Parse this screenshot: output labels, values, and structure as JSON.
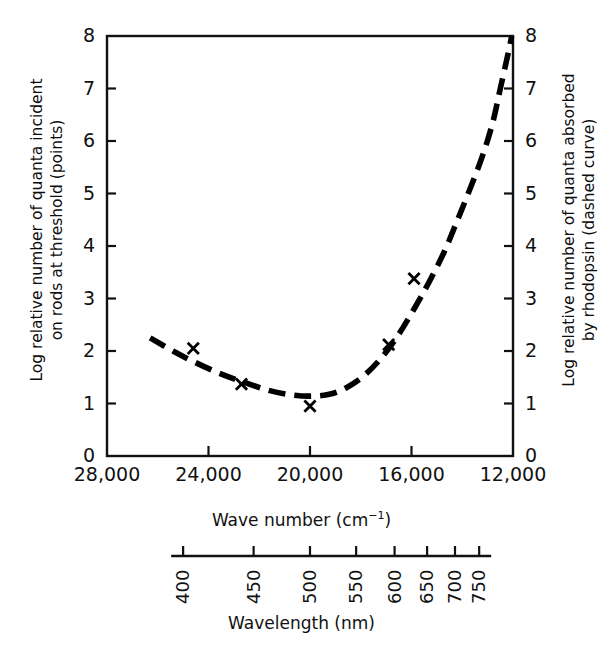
{
  "chart_data": {
    "type": "scatter",
    "title": "",
    "xlabel": "Wave number (cm⁻¹)",
    "ylabel": "Log relative number of quanta incident on rods at threshold (points)",
    "y2label": "Log relative number of quanta absorbed by rhodopsin (dashed curve)",
    "secondary_xlabel": "Wavelength (nm)",
    "xlim": [
      28000,
      12000
    ],
    "ylim": [
      0,
      8
    ],
    "y2lim": [
      0,
      8
    ],
    "x_inverted": true,
    "grid": false,
    "legend": "none",
    "xticks": [
      28000,
      24000,
      20000,
      16000,
      12000
    ],
    "xticklabels": [
      "28,000",
      "24,000",
      "20,000",
      "16,000",
      "12,000"
    ],
    "yticks": [
      0,
      1,
      2,
      3,
      4,
      5,
      6,
      7,
      8
    ],
    "yticklabels": [
      "0",
      "1",
      "2",
      "3",
      "4",
      "5",
      "6",
      "7",
      "8"
    ],
    "y2ticks": [
      0,
      1,
      2,
      3,
      4,
      5,
      6,
      7,
      8
    ],
    "y2ticklabels": [
      "0",
      "1",
      "2",
      "3",
      "4",
      "5",
      "6",
      "7",
      "8"
    ],
    "wavelength_ticks_nm": [
      400,
      450,
      500,
      550,
      600,
      650,
      700,
      750
    ],
    "wavelength_ticklabels": [
      "400",
      "450",
      "500",
      "550",
      "600",
      "650",
      "700",
      "750"
    ],
    "series": [
      {
        "name": "Log relative number of quanta incident on rods at threshold",
        "style": "points",
        "marker": "x",
        "color": "#000000",
        "points": [
          {
            "wavenumber": 24600,
            "value": 2.05
          },
          {
            "wavenumber": 22700,
            "value": 1.37
          },
          {
            "wavenumber": 20000,
            "value": 0.95
          },
          {
            "wavenumber": 16900,
            "value": 2.12
          },
          {
            "wavenumber": 15900,
            "value": 3.38
          }
        ]
      },
      {
        "name": "Log relative number of quanta absorbed by rhodopsin",
        "style": "dashed-curve",
        "color": "#000000",
        "points": [
          {
            "wavenumber": 26300,
            "value": 2.25
          },
          {
            "wavenumber": 25400,
            "value": 2.0
          },
          {
            "wavenumber": 24600,
            "value": 1.8
          },
          {
            "wavenumber": 23600,
            "value": 1.58
          },
          {
            "wavenumber": 22700,
            "value": 1.42
          },
          {
            "wavenumber": 21700,
            "value": 1.26
          },
          {
            "wavenumber": 20800,
            "value": 1.17
          },
          {
            "wavenumber": 20000,
            "value": 1.14
          },
          {
            "wavenumber": 19200,
            "value": 1.18
          },
          {
            "wavenumber": 18500,
            "value": 1.32
          },
          {
            "wavenumber": 17800,
            "value": 1.56
          },
          {
            "wavenumber": 17100,
            "value": 1.92
          },
          {
            "wavenumber": 16500,
            "value": 2.32
          },
          {
            "wavenumber": 15900,
            "value": 2.8
          },
          {
            "wavenumber": 15300,
            "value": 3.32
          },
          {
            "wavenumber": 14700,
            "value": 3.9
          },
          {
            "wavenumber": 14200,
            "value": 4.48
          },
          {
            "wavenumber": 13700,
            "value": 5.08
          },
          {
            "wavenumber": 13200,
            "value": 5.72
          },
          {
            "wavenumber": 12800,
            "value": 6.35
          },
          {
            "wavenumber": 12500,
            "value": 7.0
          },
          {
            "wavenumber": 12200,
            "value": 7.65
          },
          {
            "wavenumber": 12050,
            "value": 8.0
          }
        ]
      }
    ]
  },
  "labels": {
    "y_left_line1": "Log relative number of quanta  incident",
    "y_left_line2": "on rods at threshold (points)",
    "y_right_line1": "Log relative number of quanta absorbed",
    "y_right_line2": "by rhodopsin (dashed curve)",
    "x_axis_title_main": "Wave number (cm",
    "x_axis_title_sup": "−1",
    "x_axis_title_tail": ")",
    "x_axis_title_full": "Wave number (cm⁻¹)",
    "wavelength_axis_title": "Wavelength (nm)"
  },
  "colors": {
    "ink": "#0d0d0d",
    "background": "#ffffff",
    "curve": "#000000",
    "marker": "#000000"
  }
}
